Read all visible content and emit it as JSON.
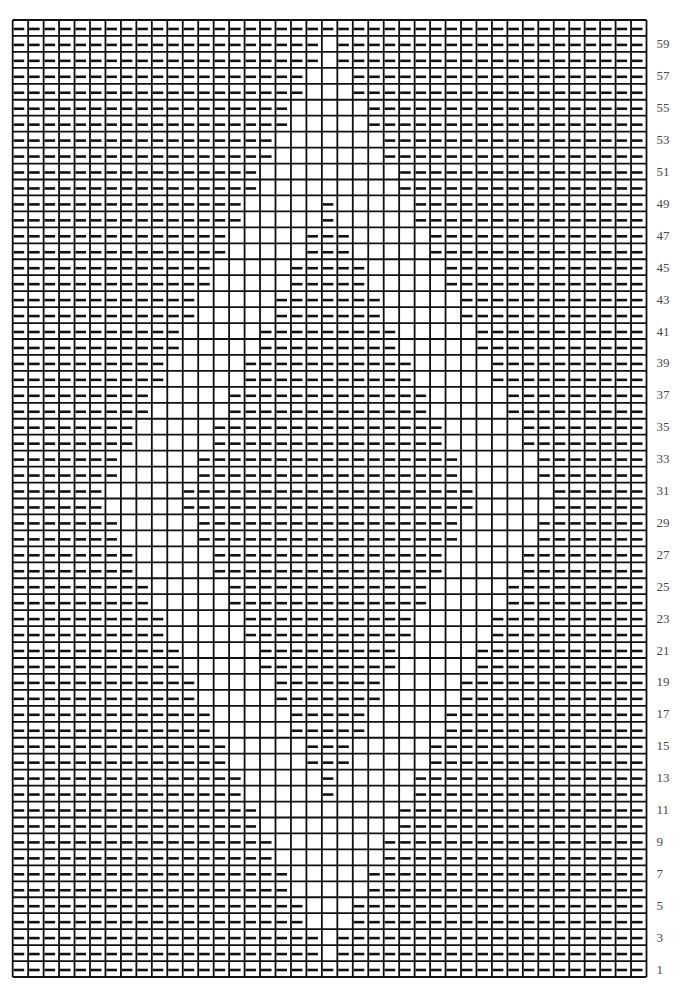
{
  "chart_data": {
    "type": "heatmap",
    "title": "",
    "columns": 41,
    "rows_count": 60,
    "legend": {
      "-": "purl",
      ".": "knit"
    },
    "row_label_side": "right",
    "row_labels": [
      "1",
      "3",
      "5",
      "7",
      "9",
      "11",
      "13",
      "15",
      "17",
      "19",
      "21",
      "23",
      "25",
      "27",
      "29",
      "31",
      "33",
      "35",
      "37",
      "39",
      "41",
      "43",
      "45",
      "47",
      "49",
      "51",
      "53",
      "55",
      "57",
      "59"
    ],
    "row_label_numbers": [
      1,
      3,
      5,
      7,
      9,
      11,
      13,
      15,
      17,
      19,
      21,
      23,
      25,
      27,
      29,
      31,
      33,
      35,
      37,
      39,
      41,
      43,
      45,
      47,
      49,
      51,
      53,
      55,
      57,
      59
    ],
    "rows_bottom_to_top": [
      "-----------------------------------------",
      "--------------------.--------------------",
      "--------------------.--------------------",
      "-------------------...-------------------",
      "-------------------...-------------------",
      "------------------.....------------------",
      "------------------.....------------------",
      "-----------------.......-----------------",
      "-----------------.......-----------------",
      "----------------.........----------------",
      "----------------.........----------------",
      "---------------.....-.....---------------",
      "---------------.....-.....---------------",
      "--------------.....---.....--------------",
      "--------------.....---.....--------------",
      "-------------.....-----.....-------------",
      "-------------.....-----.....-------------",
      "------------.....-------.....------------",
      "------------.....-------.....------------",
      "-----------.....---------.....-----------",
      "-----------.....---------.....-----------",
      "----------.....-----------.....----------",
      "----------.....-----------.....----------",
      "---------.....-------------.....---------",
      "---------.....-------------.....---------",
      "--------.....---------------.....--------",
      "--------.....---------------.....--------",
      "-------.....-----------------.....-------",
      "-------.....-----------------.....-------",
      "------.....-------------------.....------",
      "------.....-------------------.....------",
      "-------.....-----------------.....-------",
      "-------.....-----------------.....-------",
      "--------.....---------------.....--------",
      "--------.....---------------.....--------",
      "---------.....-------------.....---------",
      "---------.....-------------.....---------",
      "----------.....-----------.....----------",
      "----------.....-----------.....----------",
      "-----------.....---------.....-----------",
      "-----------.....---------.....-----------",
      "------------.....-------.....------------",
      "------------.....-------.....------------",
      "-------------.....-----.....-------------",
      "-------------.....-----.....-------------",
      "--------------.....---.....--------------",
      "--------------.....---.....--------------",
      "---------------.....-.....---------------",
      "---------------.....-.....---------------",
      "----------------.........----------------",
      "----------------.........----------------",
      "-----------------.......-----------------",
      "-----------------.......-----------------",
      "------------------.....------------------",
      "------------------.....------------------",
      "-------------------...-------------------",
      "-------------------...-------------------",
      "--------------------.--------------------",
      "--------------------.--------------------",
      "-----------------------------------------"
    ],
    "colors": {
      "ink": "#111111",
      "background": "#ffffff",
      "label": "#4a4a4a"
    }
  }
}
